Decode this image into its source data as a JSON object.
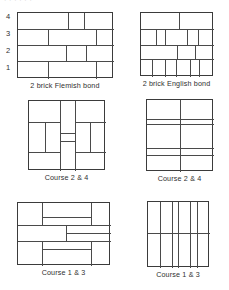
{
  "page": {
    "header_partial_text": "· · · · · ·",
    "ink_color": "#3b3b3b",
    "background_color": "#ffffff"
  },
  "course_numbers": {
    "label": "course numbers",
    "values": [
      "4",
      "3",
      "2",
      "1"
    ]
  },
  "figures": [
    {
      "id": "fig-flemish",
      "caption": "2 brick Flemish bond",
      "kind": "elevation",
      "courses": 4,
      "width_px": 96,
      "height_px": 66
    },
    {
      "id": "fig-english",
      "caption": "2 brick English bond",
      "kind": "elevation",
      "courses": 4,
      "width_px": 73,
      "height_px": 64
    },
    {
      "id": "fig-course24-l",
      "caption": "Course 2  & 4",
      "kind": "plan",
      "width_px": 77,
      "height_px": 70
    },
    {
      "id": "fig-course24-r",
      "caption": "Course 2  & 4",
      "kind": "plan",
      "width_px": 67,
      "height_px": 72
    },
    {
      "id": "fig-course13-l",
      "caption": "Course 1  & 3",
      "kind": "plan",
      "width_px": 93,
      "height_px": 63
    },
    {
      "id": "fig-course13-r",
      "caption": "Course 1  & 3",
      "kind": "plan",
      "width_px": 62,
      "height_px": 66
    }
  ]
}
